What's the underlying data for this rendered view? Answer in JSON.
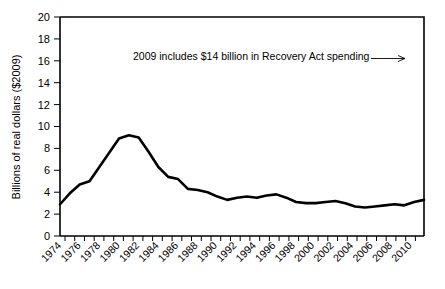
{
  "chart_data": {
    "type": "line",
    "title": "",
    "xlabel": "",
    "ylabel": "Billions of real dollars ($2009)",
    "xlim": [
      1974,
      2011
    ],
    "ylim": [
      0,
      20
    ],
    "ytick_step": 2,
    "xtick_step": 2,
    "grid": false,
    "legend": null,
    "yticks": [
      0,
      2,
      4,
      6,
      8,
      10,
      12,
      14,
      16,
      18,
      20
    ],
    "ytick_labels": [
      "0",
      "2",
      "4",
      "6",
      "8",
      "10",
      "12",
      "14",
      "16",
      "18",
      "20"
    ],
    "xticks": [
      1974,
      1976,
      1978,
      1980,
      1982,
      1984,
      1986,
      1988,
      1990,
      1992,
      1994,
      1996,
      1998,
      2000,
      2002,
      2004,
      2006,
      2008,
      2010
    ],
    "xtick_labels": [
      "1974",
      "1976",
      "1978",
      "1980",
      "1982",
      "1984",
      "1986",
      "1988",
      "1990",
      "1992",
      "1994",
      "1996",
      "1998",
      "2000",
      "2002",
      "2004",
      "2006",
      "2008",
      "2010"
    ],
    "xtick_rotation_deg": 45,
    "series": [
      {
        "name": "Real spending",
        "color": "#000000",
        "x": [
          1974,
          1975,
          1976,
          1977,
          1978,
          1979,
          1980,
          1981,
          1982,
          1983,
          1984,
          1985,
          1986,
          1987,
          1988,
          1989,
          1990,
          1991,
          1992,
          1993,
          1994,
          1995,
          1996,
          1997,
          1998,
          1999,
          2000,
          2001,
          2002,
          2003,
          2004,
          2005,
          2006,
          2007,
          2008,
          2009,
          2010,
          2011
        ],
        "values": [
          2.9,
          3.9,
          4.7,
          5.0,
          6.3,
          7.6,
          8.9,
          9.2,
          9.0,
          7.7,
          6.3,
          5.4,
          5.2,
          4.3,
          4.2,
          4.0,
          3.6,
          3.3,
          3.5,
          3.6,
          3.5,
          3.7,
          3.8,
          3.5,
          3.1,
          3.0,
          3.0,
          3.1,
          3.2,
          3.0,
          2.7,
          2.6,
          2.7,
          2.8,
          2.9,
          2.8,
          3.1,
          3.3
        ]
      }
    ],
    "annotations": [
      {
        "text": "2009 includes $14 billion in Recovery Act spending",
        "arrow": true,
        "points_to_year": 2009,
        "points_to_value": 19.1
      }
    ],
    "note_peak": {
      "year": 2009,
      "value": 19.1
    }
  }
}
